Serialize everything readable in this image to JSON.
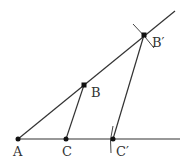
{
  "diagram": {
    "title": "",
    "points": [
      {
        "id": "A",
        "label": "A"
      },
      {
        "id": "B",
        "label": "B"
      },
      {
        "id": "C",
        "label": "C"
      },
      {
        "id": "B_prime",
        "label": "B′"
      },
      {
        "id": "C_prime",
        "label": "C′"
      }
    ],
    "segments": [
      {
        "from": "A",
        "to": "B′",
        "kind": "ray"
      },
      {
        "from": "A",
        "to": "C′",
        "kind": "ray"
      },
      {
        "from": "B",
        "to": "C",
        "kind": "segment"
      },
      {
        "from": "B′",
        "to": "C′",
        "kind": "segment"
      }
    ],
    "construction_marks": [
      "arc-at-B-prime",
      "arc-at-C-prime"
    ],
    "colors": {
      "line": "#333333",
      "point": "#111111"
    }
  }
}
